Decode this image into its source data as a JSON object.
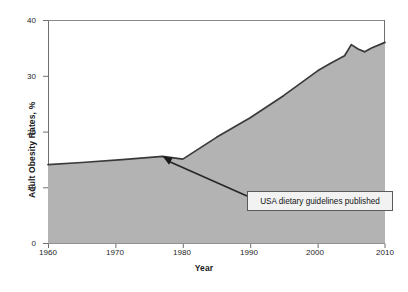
{
  "chart_data": {
    "type": "area",
    "title": "",
    "xlabel": "Year",
    "ylabel": "Adult Obesity Rates, %",
    "xlim": [
      1960,
      2010
    ],
    "ylim": [
      0,
      40
    ],
    "xticks": [
      1960,
      1970,
      1980,
      1990,
      2000,
      2010
    ],
    "xticklabels": [
      "1960",
      "1970",
      "1980",
      "1990",
      "2000",
      "2010"
    ],
    "yticks": [
      0,
      10,
      20,
      30,
      40
    ],
    "yticklabels": [
      "0",
      "10",
      "20",
      "30",
      "40"
    ],
    "grid": false,
    "legend": false,
    "fill_color": "#b3b3b3",
    "line_color": "#3a3a3a",
    "series": [
      {
        "name": "Adult Obesity Rate",
        "x": [
          1960,
          1965,
          1971,
          1977,
          1980,
          1985,
          1990,
          1995,
          2000,
          2002,
          2004,
          2005,
          2006,
          2007,
          2008,
          2010
        ],
        "values": [
          14.1,
          14.5,
          15.0,
          15.6,
          15.1,
          19.0,
          22.5,
          26.5,
          30.9,
          32.3,
          33.6,
          35.6,
          34.8,
          34.3,
          35.0,
          36.0
        ]
      }
    ],
    "annotations": [
      {
        "text": "USA dietary guidelines published",
        "anchor_x": 1977,
        "anchor_y": 15.6,
        "box_x": 1990,
        "box_y": 8.6
      }
    ]
  }
}
